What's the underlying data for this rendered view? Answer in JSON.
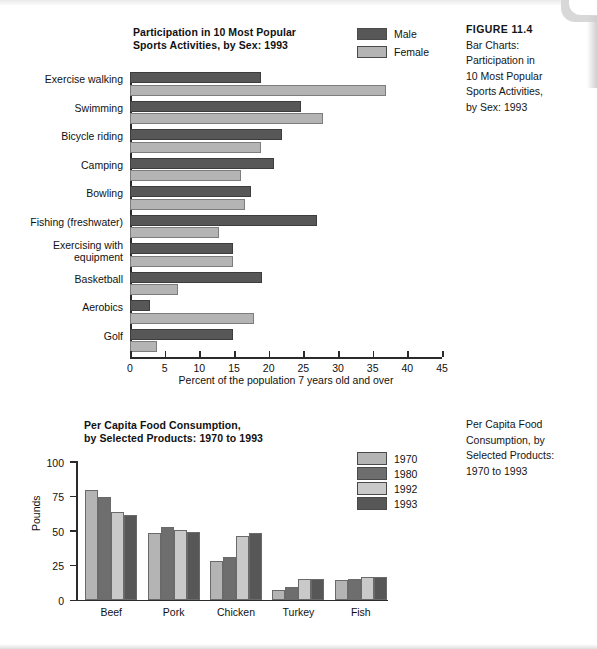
{
  "colors": {
    "series_dark": "#575757",
    "series_light": "#b4b4b4",
    "series_mid_dark": "#6e6e6e",
    "series_mid_light": "#c9c9c9",
    "axis": "#2b2b2b",
    "text": "#111111"
  },
  "figure_caption": {
    "heading": "FIGURE 11.4",
    "body": "Bar Charts:\nParticipation in\n10 Most Popular\nSports Activities,\nby Sex: 1993"
  },
  "figure_caption_2": {
    "body": "Per Capita Food\nConsumption, by\nSelected Products:\n1970 to 1993"
  },
  "chart_data": [
    {
      "type": "bar",
      "orientation": "horizontal",
      "title": "Participation in 10 Most Popular\nSports Activities, by Sex: 1993",
      "xlabel": "Percent of the population 7 years old and over",
      "ylabel": "",
      "xlim": [
        0,
        45
      ],
      "xticks": [
        0,
        5,
        10,
        15,
        20,
        25,
        30,
        35,
        40,
        45
      ],
      "grid": false,
      "legend_position": "top-right",
      "categories": [
        "Exercise walking",
        "Swimming",
        "Bicycle riding",
        "Camping",
        "Bowling",
        "Fishing (freshwater)",
        "Exercising with\nequipment",
        "Basketball",
        "Aerobics",
        "Golf"
      ],
      "series": [
        {
          "name": "Male",
          "color": "#575757",
          "values": [
            18.9,
            24.6,
            21.9,
            20.7,
            17.5,
            27.0,
            14.8,
            19.0,
            2.9,
            14.9
          ]
        },
        {
          "name": "Female",
          "color": "#b4b4b4",
          "values": [
            36.9,
            27.9,
            18.9,
            16.0,
            16.6,
            12.8,
            14.8,
            6.9,
            17.9,
            3.9
          ]
        }
      ]
    },
    {
      "type": "bar",
      "orientation": "vertical",
      "title": "Per Capita Food Consumption,\nby Selected Products: 1970 to 1993",
      "xlabel": "",
      "ylabel": "Pounds",
      "ylim": [
        0,
        100
      ],
      "yticks": [
        0,
        25,
        50,
        75,
        100
      ],
      "grid": false,
      "legend_position": "right",
      "categories": [
        "Beef",
        "Pork",
        "Chicken",
        "Turkey",
        "Fish"
      ],
      "series": [
        {
          "name": "1970",
          "color": "#b4b4b4",
          "values": [
            79,
            48,
            28,
            7,
            14
          ]
        },
        {
          "name": "1980",
          "color": "#6e6e6e",
          "values": [
            74,
            52,
            31,
            9,
            15
          ]
        },
        {
          "name": "1992",
          "color": "#c9c9c9",
          "values": [
            63,
            50,
            46,
            15,
            16
          ]
        },
        {
          "name": "1993",
          "color": "#575757",
          "values": [
            61,
            49,
            48,
            15,
            16
          ]
        }
      ]
    }
  ]
}
